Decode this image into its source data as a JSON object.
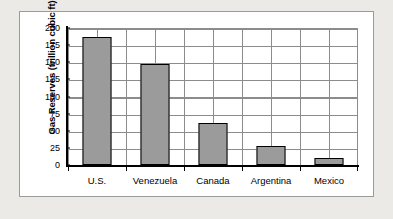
{
  "chart_data": {
    "type": "bar",
    "title": "",
    "xlabel": "",
    "ylabel": "Gas Reserves (trillion cubic ft)",
    "categories": [
      "U.S.",
      "Venezuela",
      "Canada",
      "Argentina",
      "Mexico"
    ],
    "values": [
      187,
      148,
      61,
      28,
      10
    ],
    "ylim": [
      0,
      200
    ],
    "yticks": [
      200,
      175,
      150,
      125,
      100,
      75,
      50,
      25,
      0
    ],
    "ytick_labels": [
      "200",
      "175",
      "150",
      "125",
      "100",
      "75",
      "50",
      "25",
      "0"
    ],
    "grid": true,
    "legend": false,
    "series": [
      {
        "name": "Gas Reserves",
        "values": [
          187,
          148,
          61,
          28,
          10
        ]
      }
    ],
    "colors": {
      "bar_fill": "#9b9b9b",
      "bar_border": "#000000",
      "gridline": "#8c8c8c",
      "axis": "#000000",
      "plot_background": "#ffffff",
      "page_background": "#eceae6",
      "frame_border": "#9a9a96"
    }
  }
}
